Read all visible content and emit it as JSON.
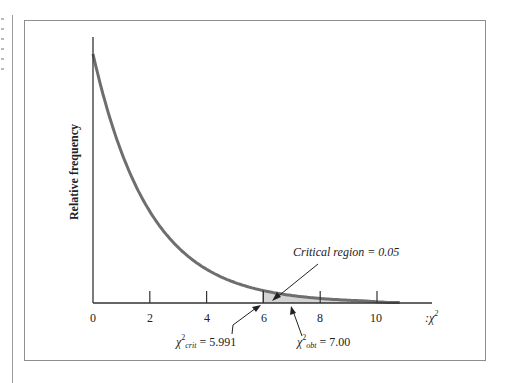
{
  "chart_data": {
    "type": "line",
    "title": "",
    "xlabel": ":χ²",
    "ylabel": "Relative frequency",
    "xlim": [
      0,
      11
    ],
    "x_ticks": [
      0,
      2,
      4,
      6,
      8,
      10
    ],
    "x_tick_labels": [
      "0",
      "2",
      "4",
      "6",
      "8",
      "10"
    ],
    "grid": false,
    "legend": null,
    "series": [
      {
        "name": "chi-square distribution (df = 2)",
        "x": [
          0,
          0.5,
          1,
          1.5,
          2,
          3,
          4,
          5,
          6,
          7,
          8,
          9,
          10,
          10.8
        ],
        "values": [
          0.5,
          0.389,
          0.303,
          0.236,
          0.184,
          0.112,
          0.068,
          0.041,
          0.025,
          0.015,
          0.009,
          0.006,
          0.003,
          0.0
        ]
      }
    ],
    "shaded_region": {
      "from": 5.991,
      "to": 10.8,
      "label": "Critical region = 0.05"
    },
    "annotations": [
      {
        "text": "Critical region = 0.05",
        "points_to": 6.4
      },
      {
        "symbol": "χ²",
        "subscript": "crit",
        "text": "= 5.991",
        "x": 5.991
      },
      {
        "symbol": "χ²",
        "subscript": "obt",
        "text": "= 7.00",
        "x": 7.0
      }
    ]
  },
  "labels": {
    "ylabel": "Relative frequency",
    "xlabel_prefix": ":χ",
    "xlabel_sup": "2",
    "critical_region": "Critical region = 0.05",
    "crit_symbol": "χ",
    "crit_sup": "2",
    "crit_sub": "crit",
    "crit_value": " = 5.991",
    "obt_symbol": "χ",
    "obt_sup": "2",
    "obt_sub": "obt",
    "obt_value": " = 7.00",
    "ticks": [
      "0",
      "2",
      "4",
      "6",
      "8",
      "10"
    ]
  },
  "colors": {
    "curve": "#6e6e6e",
    "shade": "#d4d4d4",
    "axis": "#333333",
    "frame": "#8e8e8e"
  }
}
